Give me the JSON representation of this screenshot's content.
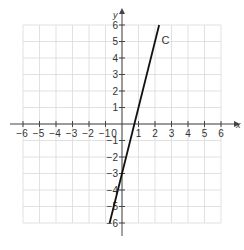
{
  "chart_data": {
    "type": "line",
    "title": "",
    "xlabel": "x",
    "ylabel": "y",
    "xlim": [
      -6,
      6
    ],
    "ylim": [
      -6,
      6
    ],
    "grid": true,
    "x_ticks": [
      -6,
      -5,
      -4,
      -3,
      -2,
      -1,
      1,
      2,
      3,
      4,
      5,
      6
    ],
    "y_ticks": [
      -6,
      -5,
      -4,
      -3,
      -2,
      -1,
      1,
      2,
      3,
      4,
      5,
      6
    ],
    "x_tick_labels": [
      "−6",
      "−5",
      "−4",
      "−3",
      "−2",
      "−1",
      "1",
      "2",
      "3",
      "4",
      "5",
      "6"
    ],
    "y_tick_labels": [
      "−6",
      "−5",
      "−4",
      "−3",
      "−2",
      "−1",
      "1",
      "2",
      "3",
      "4",
      "5",
      "6"
    ],
    "origin_label": "0",
    "series": [
      {
        "name": "C",
        "equation": "y = 4x - 3",
        "x": [
          -0.75,
          2.25
        ],
        "y": [
          -6,
          6
        ],
        "color": "#111111"
      }
    ],
    "annotations": [
      {
        "text": "C",
        "x": 2.4,
        "y": 4.85
      }
    ]
  },
  "colors": {
    "grid": "#d9d9d9",
    "axis": "#444444",
    "line": "#111111",
    "label": "#333333"
  }
}
